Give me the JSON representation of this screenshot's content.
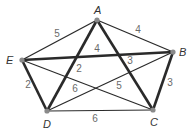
{
  "diagram": {
    "type": "weighted-graph",
    "vertices": [
      {
        "id": "A",
        "label": "A",
        "x": 97,
        "y": 20
      },
      {
        "id": "B",
        "label": "B",
        "x": 173,
        "y": 52
      },
      {
        "id": "C",
        "label": "C",
        "x": 153,
        "y": 110
      },
      {
        "id": "D",
        "label": "D",
        "x": 47,
        "y": 111
      },
      {
        "id": "E",
        "label": "E",
        "x": 22,
        "y": 60
      }
    ],
    "edges": [
      {
        "from": "A",
        "to": "E",
        "weight": "5",
        "thick": false,
        "lx": 57,
        "ly": 37
      },
      {
        "from": "A",
        "to": "B",
        "weight": "4",
        "thick": false,
        "lx": 138,
        "ly": 33
      },
      {
        "from": "E",
        "to": "B",
        "weight": "4",
        "thick": true,
        "lx": 97,
        "ly": 52
      },
      {
        "from": "A",
        "to": "D",
        "weight": "2",
        "thick": true,
        "lx": 79,
        "ly": 72
      },
      {
        "from": "A",
        "to": "C",
        "weight": "3",
        "thick": true,
        "lx": 130,
        "ly": 64
      },
      {
        "from": "B",
        "to": "C",
        "weight": "3",
        "thick": true,
        "lx": 170,
        "ly": 86
      },
      {
        "from": "E",
        "to": "D",
        "weight": "2",
        "thick": true,
        "lx": 28,
        "ly": 88
      },
      {
        "from": "D",
        "to": "C",
        "weight": "6",
        "thick": false,
        "lx": 95,
        "ly": 122
      },
      {
        "from": "E",
        "to": "C",
        "weight": "6",
        "thick": false,
        "lx": 75,
        "ly": 92
      },
      {
        "from": "D",
        "to": "B",
        "weight": "5",
        "thick": false,
        "lx": 119,
        "ly": 89
      }
    ],
    "colors": {
      "edge": "#2a2a2a",
      "vertex": "#8a8a8a",
      "vertex_label": "#333333",
      "weight_label": "#6a6a6a"
    }
  }
}
